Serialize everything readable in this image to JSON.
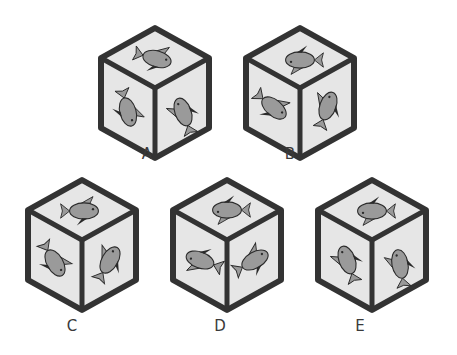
{
  "puzzle": {
    "type": "cube-folding-options",
    "colors": {
      "face": "#e6e6e6",
      "edge": "#333333",
      "fish_body": "#9a9a9a",
      "fish_outline": "#2a2a2a",
      "fin_dark": "#2a2a2a"
    },
    "options": [
      {
        "label": "A",
        "faces": {
          "top": "fish-right-up",
          "left": "fish-down-tilted",
          "right": "fish-down-left"
        }
      },
      {
        "label": "B",
        "faces": {
          "top": "fish-left",
          "left": "fish-down-right",
          "right": "fish-up-right"
        }
      },
      {
        "label": "C",
        "faces": {
          "top": "fish-right",
          "left": "fish-down-tilted",
          "right": "fish-left-down"
        }
      },
      {
        "label": "D",
        "faces": {
          "top": "fish-left",
          "left": "fish-left",
          "right": "fish-right"
        }
      },
      {
        "label": "E",
        "faces": {
          "top": "fish-left",
          "left": "fish-up",
          "right": "fish-down-left"
        }
      }
    ]
  }
}
